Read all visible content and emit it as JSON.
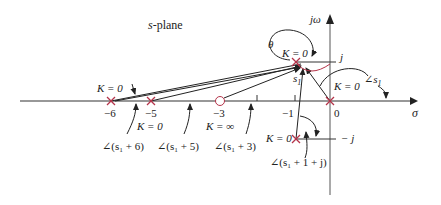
{
  "title": "s-plane",
  "title_prefix": "s",
  "title_suffix": "-plane",
  "axes": {
    "x_label": "σ",
    "y_label": "jω",
    "ticks": {
      "neg6": "−6",
      "neg5": "−5",
      "neg3": "−3",
      "neg1": "−1",
      "zero": "0",
      "j": "j",
      "neg_j": "− j"
    }
  },
  "labels": {
    "k0_left": "K = 0",
    "k0_minus5": "K = 0",
    "k_inf": "K = ∞",
    "k0_upper": "K = 0",
    "k0_origin": "K = 0",
    "k0_lower": "K = 0",
    "theta": "θ",
    "s1": "s",
    "s1_sub": "1",
    "angle_s1": "∠s",
    "angle_s1_sub": "1",
    "angle_s1_plus6": "∠(s₁ + 6)",
    "angle_s1_plus5": "∠(s₁ + 5)",
    "angle_s1_plus3": "∠(s₁ + 3)",
    "angle_s1_plus1j": "∠(s₁ + 1 + j)"
  },
  "colors": {
    "pole": "#b5344a",
    "line": "#222222",
    "axis": "#333333"
  }
}
